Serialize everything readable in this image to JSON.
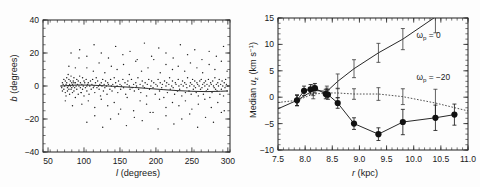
{
  "figure": {
    "background": "#fdfdfd",
    "ink": "#1c1c1c"
  },
  "chart_data": [
    {
      "type": "scatter",
      "panel": "left",
      "title": "",
      "xlabel": "l (degrees)",
      "ylabel": "b (degrees)",
      "xlim": [
        43,
        303
      ],
      "ylim": [
        -40,
        40
      ],
      "xticks": [
        50,
        100,
        150,
        200,
        250,
        300
      ],
      "xticklabels": [
        "50",
        "100",
        "150",
        "200",
        "250",
        "300"
      ],
      "yticks": [
        -40,
        -20,
        0,
        20,
        40
      ],
      "yticklabels": [
        "-40",
        "-20",
        "0",
        "20",
        "40"
      ],
      "xminor_step": 10,
      "yminor_step": 5,
      "grid": false,
      "legend": "none",
      "marker": "small-dot",
      "series": [
        {
          "name": "stars",
          "style": "points",
          "x": [
            68,
            69,
            70,
            70,
            71,
            72,
            72,
            73,
            74,
            74,
            75,
            75,
            76,
            76,
            77,
            77,
            78,
            78,
            79,
            79,
            80,
            80,
            81,
            81,
            82,
            82,
            83,
            83,
            84,
            84,
            85,
            85,
            86,
            86,
            87,
            88,
            88,
            89,
            90,
            90,
            91,
            92,
            92,
            93,
            94,
            95,
            95,
            96,
            97,
            98,
            98,
            99,
            100,
            100,
            101,
            102,
            103,
            104,
            104,
            105,
            106,
            107,
            108,
            109,
            110,
            111,
            112,
            113,
            114,
            115,
            116,
            117,
            118,
            119,
            120,
            121,
            122,
            123,
            124,
            125,
            126,
            127,
            128,
            129,
            130,
            131,
            132,
            133,
            134,
            136,
            137,
            138,
            139,
            140,
            142,
            143,
            144,
            146,
            147,
            148,
            150,
            151,
            152,
            154,
            155,
            157,
            158,
            160,
            161,
            163,
            164,
            166,
            167,
            169,
            170,
            172,
            173,
            175,
            176,
            178,
            179,
            181,
            182,
            184,
            185,
            187,
            188,
            190,
            191,
            193,
            194,
            196,
            197,
            199,
            200,
            202,
            203,
            205,
            206,
            208,
            209,
            211,
            212,
            214,
            215,
            216,
            218,
            219,
            220,
            222,
            223,
            224,
            226,
            227,
            228,
            230,
            231,
            232,
            233,
            235,
            236,
            237,
            238,
            240,
            241,
            242,
            243,
            244,
            246,
            247,
            248,
            249,
            250,
            251,
            252,
            253,
            254,
            255,
            256,
            257,
            258,
            259,
            260,
            261,
            262,
            263,
            264,
            265,
            266,
            267,
            268,
            269,
            270,
            271,
            272,
            273,
            274,
            275,
            276,
            277,
            278,
            279,
            280,
            281,
            282,
            283,
            284,
            285,
            286,
            287,
            288,
            289,
            290,
            291,
            292,
            293,
            294,
            295,
            296,
            297,
            298,
            299,
            300,
            86,
            96,
            104,
            113,
            121,
            129,
            138,
            146,
            155,
            163,
            172,
            180,
            189,
            197,
            206,
            214,
            223,
            231,
            240,
            248,
            257,
            265,
            274,
            282,
            291,
            299,
            79,
            88,
            97,
            106,
            115,
            124,
            133,
            142,
            151,
            160,
            169,
            178,
            187,
            196,
            205,
            214,
            223,
            232,
            241,
            250,
            259,
            268,
            277,
            286,
            295,
            74,
            84,
            94,
            104,
            114,
            124,
            134,
            144,
            154,
            164,
            174,
            184,
            194,
            204,
            214,
            224,
            234,
            244,
            254,
            264,
            274,
            284,
            294,
            82,
            93,
            104,
            115,
            126,
            137,
            148,
            159,
            170,
            181,
            192,
            203,
            214,
            225,
            236,
            247,
            258,
            269,
            280,
            291
          ],
          "y": [
            0,
            -1,
            2,
            -3,
            1,
            -2,
            4,
            0,
            -4,
            3,
            1,
            -6,
            2,
            5,
            -1,
            -3,
            0,
            7,
            -2,
            4,
            1,
            -5,
            3,
            0,
            -2,
            6,
            -1,
            2,
            -4,
            1,
            0,
            3,
            -3,
            5,
            -1,
            2,
            -7,
            0,
            4,
            -2,
            1,
            -5,
            3,
            0,
            6,
            -1,
            2,
            -4,
            1,
            -2,
            5,
            0,
            3,
            -6,
            2,
            -1,
            4,
            0,
            -3,
            1,
            2,
            -5,
            0,
            3,
            -2,
            1,
            4,
            -1,
            0,
            -4,
            2,
            5,
            -1,
            3,
            0,
            -2,
            1,
            -6,
            2,
            0,
            4,
            -3,
            1,
            -1,
            3,
            0,
            -5,
            2,
            1,
            -2,
            4,
            0,
            -3,
            1,
            5,
            -1,
            2,
            0,
            -4,
            3,
            1,
            -2,
            0,
            4,
            -1,
            2,
            -5,
            1,
            3,
            0,
            -2,
            4,
            -1,
            1,
            -3,
            2,
            0,
            5,
            -2,
            1,
            -4,
            3,
            0,
            -1,
            2,
            -6,
            1,
            4,
            -2,
            0,
            3,
            -1,
            2,
            -5,
            1,
            0,
            4,
            -3,
            2,
            -1,
            1,
            -7,
            3,
            0,
            2,
            -4,
            1,
            5,
            -2,
            0,
            3,
            -1,
            -5,
            2,
            1,
            -3,
            4,
            0,
            -2,
            1,
            -6,
            3,
            0,
            2,
            -4,
            1,
            -1,
            5,
            -3,
            0,
            2,
            -5,
            1,
            4,
            -2,
            0,
            3,
            -1,
            -4,
            2,
            1,
            -6,
            0,
            3,
            -2,
            4,
            -1,
            1,
            -5,
            2,
            0,
            3,
            -3,
            1,
            -2,
            4,
            0,
            -7,
            2,
            1,
            -4,
            3,
            0,
            -1,
            5,
            -2,
            1,
            -3,
            2,
            0,
            4,
            -5,
            1,
            -2,
            3,
            0,
            -6,
            2,
            -1,
            4,
            1,
            -3,
            0,
            2,
            -4,
            11,
            9,
            14,
            8,
            12,
            10,
            13,
            7,
            15,
            9,
            11,
            16,
            8,
            13,
            10,
            12,
            9,
            14,
            11,
            8,
            13,
            10,
            15,
            9,
            12,
            11,
            -11,
            -9,
            -13,
            -8,
            -12,
            -10,
            -14,
            -7,
            -15,
            -9,
            -11,
            -16,
            -8,
            -13,
            -10,
            -12,
            -9,
            -14,
            -11,
            -8,
            -13,
            -10,
            -15,
            -9,
            -12,
            22,
            18,
            25,
            20,
            17,
            24,
            19,
            21,
            16,
            26,
            18,
            23,
            20,
            17,
            25,
            19,
            22,
            16,
            21,
            18,
            24,
            20,
            17,
            -22,
            -18,
            -25,
            -20,
            -17,
            -24,
            -19,
            -21,
            -16,
            -26,
            -18,
            -23,
            -20,
            -17,
            -25,
            -19,
            -22,
            -16,
            -21,
            -18
          ]
        },
        {
          "name": "fitted-mean-curve",
          "style": "line",
          "x": [
            68,
            90,
            110,
            130,
            150,
            170,
            190,
            210,
            230,
            250,
            270,
            290,
            300
          ],
          "y": [
            0.0,
            0.6,
            0.5,
            0.1,
            -0.4,
            -0.9,
            -1.5,
            -2.2,
            -2.8,
            -3.2,
            -3.4,
            -3.2,
            -3.0
          ]
        }
      ]
    },
    {
      "type": "line",
      "panel": "right",
      "title": "",
      "xlabel": "r (kpc)",
      "ylabel": "Median u_z (km s^-1)",
      "ylabel_parts": {
        "prefix": "Median ",
        "symbol": "u",
        "subscript": "z",
        "units": " (km s",
        "exponent": "-1",
        "suffix": ")"
      },
      "xlim": [
        7.5,
        11.0
      ],
      "ylim": [
        -10,
        15
      ],
      "xticks": [
        7.5,
        8.0,
        8.5,
        9.0,
        9.5,
        10.0,
        10.5,
        11.0
      ],
      "xticklabels": [
        "7.5",
        "8.0",
        "8.5",
        "9.0",
        "9.5",
        "10.0",
        "10.5",
        "11.0"
      ],
      "yticks": [
        -10,
        -5,
        0,
        5,
        10,
        15
      ],
      "yticklabels": [
        "-10",
        "-5",
        "0",
        "5",
        "10",
        "15"
      ],
      "xminor_step": 0.1,
      "yminor_step": 1,
      "grid": false,
      "legend": "inline-annotations",
      "annotations": [
        {
          "text_prefix": "ω",
          "text_sub": "p",
          "text_rest": " = 0",
          "x": 10.05,
          "y": 11.2
        },
        {
          "text_prefix": "ω",
          "text_sub": "p",
          "text_rest": " = −20",
          "x": 10.05,
          "y": 3.2
        }
      ],
      "series": [
        {
          "name": "omega_p = 0 model",
          "style": "solid-line-open-errorbar",
          "x": [
            7.5,
            7.85,
            8.15,
            8.4,
            8.6,
            8.9,
            9.35,
            9.8,
            10.4
          ],
          "y": [
            -2.2,
            -0.6,
            1.3,
            1.1,
            3.0,
            5.4,
            8.4,
            11.0,
            15.2
          ],
          "yerr": [
            0.0,
            1.0,
            1.0,
            1.0,
            1.4,
            1.7,
            1.8,
            2.0,
            3.0
          ],
          "marker_x": [
            7.85,
            8.15,
            8.4,
            8.6,
            8.9,
            9.35,
            9.8,
            10.4
          ],
          "marker_y": [
            -0.6,
            1.3,
            1.1,
            3.0,
            5.4,
            8.4,
            11.0,
            15.2
          ]
        },
        {
          "name": "omega_p = -20 model",
          "style": "dotted-line-open-errorbar",
          "x": [
            7.5,
            7.85,
            8.15,
            8.4,
            8.6,
            8.9,
            9.35,
            9.8,
            10.4,
            11.0
          ],
          "y": [
            -1.0,
            -0.6,
            0.6,
            0.8,
            0.8,
            0.6,
            0.6,
            0.1,
            -1.1,
            -2.6
          ],
          "yerr": [
            0.0,
            1.0,
            0.9,
            0.9,
            0.9,
            1.0,
            1.2,
            1.5,
            2.6,
            0.0
          ],
          "marker_x": [
            7.85,
            8.15,
            8.4,
            8.6,
            8.9,
            9.35,
            9.8,
            10.4
          ],
          "marker_y": [
            -0.6,
            0.6,
            0.8,
            0.8,
            0.6,
            0.6,
            0.1,
            -1.1
          ]
        },
        {
          "name": "observed median",
          "style": "solid-line-filled-circle",
          "x": [
            7.85,
            7.98,
            8.1,
            8.18,
            8.38,
            8.42,
            8.6,
            8.9,
            9.35,
            9.8,
            10.4,
            10.75
          ],
          "y": [
            -0.6,
            1.2,
            1.5,
            1.7,
            0.6,
            0.5,
            -1.1,
            -5.0,
            -7.0,
            -4.7,
            -3.9,
            -3.3
          ],
          "yerr": [
            1.0,
            0.9,
            0.9,
            0.9,
            0.9,
            0.9,
            1.0,
            1.1,
            1.2,
            2.4,
            2.4,
            2.0
          ]
        }
      ]
    }
  ]
}
